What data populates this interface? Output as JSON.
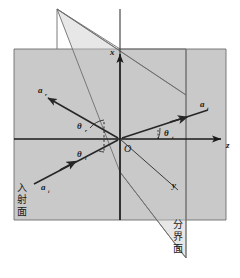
{
  "figure": {
    "background_color": "#ffffff",
    "plane_fill_color": "#c9c9c9",
    "plane_stroke_color": "#6e6e6e",
    "ray_color": "#262626",
    "axis_color": "#1a1a1a"
  },
  "axes": [
    {
      "name": "x-axis",
      "label": "x",
      "direction": "up"
    },
    {
      "name": "y-axis",
      "label": "y",
      "direction": "into-page-lower-right"
    },
    {
      "name": "z-axis",
      "label": "z",
      "direction": "right"
    }
  ],
  "origin": {
    "label": "O"
  },
  "vectors": [
    {
      "name": "reflected-ray",
      "label": "a",
      "subscript": "r",
      "description": "reflected ray travelling up and to the left"
    },
    {
      "name": "transmitted-ray",
      "label": "a",
      "subscript": "t",
      "description": "transmitted ray travelling up and to the right"
    },
    {
      "name": "incident-ray",
      "label": "a",
      "subscript": "i",
      "description": "incident ray travelling up and to the right toward the origin"
    }
  ],
  "angles": [
    {
      "name": "reflection-angle",
      "label": "θ",
      "subscript": "r",
      "description": "angle between reflected ray and the normal"
    },
    {
      "name": "incidence-angle",
      "label": "θ",
      "subscript": "i",
      "description": "angle between incident ray and the normal"
    },
    {
      "name": "transmission-angle",
      "label": "θ",
      "subscript": "t",
      "description": "angle between transmitted ray and the z axis"
    }
  ],
  "plane_labels": [
    {
      "name": "plane-of-incidence-label",
      "text": "入射面",
      "chars": [
        "入",
        "射",
        "面"
      ],
      "meaning": "plane of incidence",
      "orientation": "vertical"
    },
    {
      "name": "interface-plane-label",
      "text": "分界面",
      "chars": [
        "分",
        "界",
        "面"
      ],
      "meaning": "interface / boundary plane",
      "orientation": "vertical"
    }
  ]
}
